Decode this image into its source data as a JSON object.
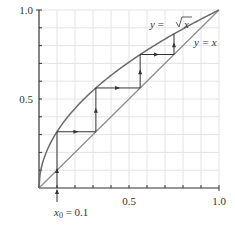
{
  "chart_data": {
    "type": "line",
    "title": "",
    "xlabel": "",
    "ylabel": "",
    "xlim": [
      0,
      1.0
    ],
    "ylim": [
      0,
      1.0
    ],
    "grid": true,
    "x_ticks": [
      0.1,
      0.2,
      0.3,
      0.4,
      0.5,
      0.6,
      0.7,
      0.8,
      0.9,
      1.0
    ],
    "x_tick_labels": [
      {
        "value": 0.5,
        "label": "0.5"
      },
      {
        "value": 1.0,
        "label": "1.0"
      }
    ],
    "y_ticks": [
      0.1,
      0.2,
      0.3,
      0.4,
      0.5,
      0.6,
      0.7,
      0.8,
      0.9,
      1.0
    ],
    "y_tick_labels": [
      {
        "value": 0.5,
        "label": "0.5"
      },
      {
        "value": 1.0,
        "label": "1.0"
      }
    ],
    "series": [
      {
        "name": "y = √x",
        "function": "sqrt(x)",
        "color": "#666666"
      },
      {
        "name": "y = x",
        "function": "x",
        "color": "#888888"
      }
    ],
    "cobweb": {
      "start_x": 0.1,
      "iterates": [
        0.1,
        0.316,
        0.562,
        0.75,
        0.866
      ],
      "color": "#333333"
    },
    "annotations": [
      {
        "text": "y = √x",
        "x": 0.62,
        "y": 0.92
      },
      {
        "text": "y = x",
        "x": 0.84,
        "y": 0.82
      },
      {
        "text": "x₀ = 0.1",
        "x": 0.1,
        "y": -0.2
      }
    ]
  },
  "labels": {
    "x_half": "0.5",
    "x_one": "1.0",
    "y_half": "0.5",
    "y_one": "1.0",
    "sqrt_curve_y": "y",
    "sqrt_curve_eq": " = ",
    "sqrt_curve_x": "x",
    "identity_label": "y = x",
    "x0_var": "x",
    "x0_sub": "0",
    "x0_value": " = 0.1"
  }
}
